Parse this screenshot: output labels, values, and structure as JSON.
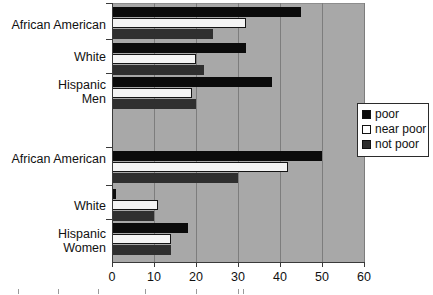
{
  "chart_data": {
    "type": "bar",
    "orientation": "horizontal",
    "title": "",
    "xlabel": "",
    "ylabel": "",
    "xlim": [
      0,
      60
    ],
    "xticks": [
      0,
      10,
      20,
      30,
      40,
      50,
      60
    ],
    "grid": true,
    "legend_position": "right",
    "categories": [
      "African American Men",
      "White Men",
      "Hispanic Men",
      "African American Women",
      "White Women",
      "Hispanic Women"
    ],
    "series": [
      {
        "name": "poor",
        "values": [
          45,
          32,
          38,
          50,
          1,
          18
        ]
      },
      {
        "name": "near poor",
        "values": [
          32,
          20,
          19,
          42,
          11,
          14
        ]
      },
      {
        "name": "not poor",
        "values": [
          24,
          22,
          20,
          30,
          10,
          14
        ]
      }
    ]
  },
  "axis": {
    "ticks": [
      "0",
      "10",
      "20",
      "30",
      "40",
      "50",
      "60"
    ]
  },
  "groups": [
    {
      "line1": "African American",
      "line2": "",
      "gender": "Men"
    },
    {
      "line1": "White",
      "line2": "",
      "gender": "Men"
    },
    {
      "line1": "Hispanic",
      "line2": "Men",
      "gender": "Men"
    },
    {
      "line1": "African American",
      "line2": "",
      "gender": "Women"
    },
    {
      "line1": "White",
      "line2": "",
      "gender": "Women"
    },
    {
      "line1": "Hispanic",
      "line2": "Women",
      "gender": "Women"
    }
  ],
  "labels": {
    "african_american_men": "African American",
    "white_men": "White",
    "hispanic_men_l1": "Hispanic",
    "hispanic_men_l2": "Men",
    "african_american_women": "African American",
    "white_women": "White",
    "hispanic_women_l1": "Hispanic",
    "hispanic_women_l2": "Women"
  },
  "legend": {
    "items": [
      {
        "label": "poor",
        "color": "#0b0b0b"
      },
      {
        "label": "near poor",
        "color": "#ffffff"
      },
      {
        "label": "not poor",
        "color": "#2f2f2f"
      }
    ]
  },
  "colors": {
    "plot_background": "#a8a8a8",
    "poor": "#0b0b0b",
    "near_poor": "#f4f4f4",
    "not_poor": "#2f2f2f",
    "axis": "#3a3a3a",
    "gridline": "#7d7d7d"
  }
}
